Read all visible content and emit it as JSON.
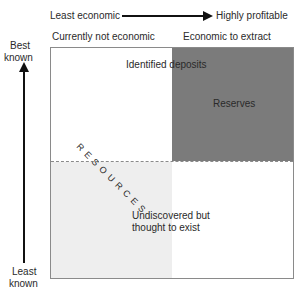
{
  "top_axis": {
    "left_label": "Least economic",
    "right_label": "Highly profitable"
  },
  "column_headers": {
    "left": "Currently not economic",
    "right": "Economic to extract"
  },
  "left_axis": {
    "top_label_line1": "Best",
    "top_label_line2": "known",
    "bottom_label_line1": "Least",
    "bottom_label_line2": "known"
  },
  "regions": {
    "identified": "Identified deposits",
    "reserves": "Reserves",
    "resources": "RESOURCES",
    "undiscovered_line1": "Undiscovered but",
    "undiscovered_line2": "thought to exist"
  },
  "colors": {
    "reserves_fill": "#7b7b7b",
    "undiscovered_uneconomic_fill": "#eeeeee",
    "border": "#8a8a8a"
  }
}
